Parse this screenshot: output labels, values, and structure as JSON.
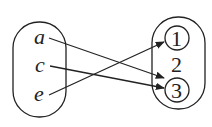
{
  "diagram": {
    "type": "function-mapping",
    "domain_set": {
      "elements": [
        "a",
        "c",
        "e"
      ]
    },
    "codomain_set": {
      "elements": [
        "1",
        "2",
        "3"
      ],
      "circled": [
        "1",
        "3"
      ]
    },
    "mappings": [
      {
        "from": "a",
        "to": "3"
      },
      {
        "from": "c",
        "to": "3"
      },
      {
        "from": "e",
        "to": "1"
      }
    ],
    "colors": {
      "stroke": "#222222",
      "background": "#ffffff"
    }
  }
}
